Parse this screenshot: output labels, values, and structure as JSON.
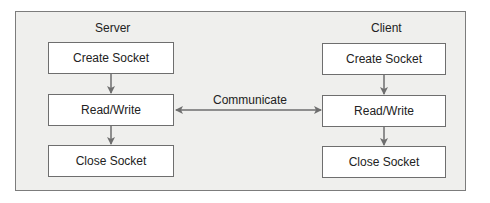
{
  "diagram": {
    "server": {
      "title": "Server",
      "steps": [
        "Create Socket",
        "Read/Write",
        "Close Socket"
      ]
    },
    "client": {
      "title": "Client",
      "steps": [
        "Create Socket",
        "Read/Write",
        "Close Socket"
      ]
    },
    "link": {
      "label": "Communicate",
      "direction": "bidirectional"
    },
    "colors": {
      "frame_bg": "#efefed",
      "frame_border": "#7c7c7c",
      "box_bg": "#ffffff",
      "box_border": "#6e6e6e",
      "arrow": "#6e6e6e"
    }
  }
}
